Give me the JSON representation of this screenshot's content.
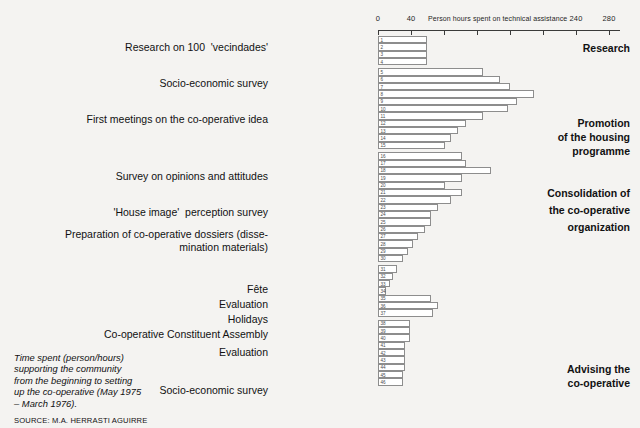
{
  "chart_data": {
    "type": "bar",
    "orientation": "horizontal",
    "title": "",
    "xlabel": "Person hours spent on technical assistance",
    "ylabel": "",
    "xlim": [
      0,
      290
    ],
    "grid": false,
    "legend_position": "right-inline",
    "axis": {
      "ticks": [
        0,
        40,
        80,
        120,
        160,
        200,
        240,
        280
      ],
      "tick_labels_shown": [
        "0",
        "40",
        "240",
        "280"
      ]
    },
    "categories": [
      "1",
      "2",
      "3",
      "4",
      "5",
      "6",
      "7",
      "8",
      "9",
      "10",
      "11",
      "12",
      "13",
      "14",
      "15",
      "16",
      "17",
      "18",
      "19",
      "20",
      "21",
      "22",
      "23",
      "24",
      "25",
      "26",
      "27",
      "28",
      "29",
      "30",
      "31",
      "32",
      "33",
      "34",
      "35",
      "36",
      "37",
      "38",
      "39",
      "40",
      "41",
      "42",
      "43",
      "44",
      "45",
      "46"
    ],
    "values": [
      59,
      59,
      59,
      59,
      126,
      146,
      158,
      187,
      167,
      156,
      126,
      106,
      96,
      88,
      80,
      101,
      106,
      136,
      101,
      80,
      101,
      88,
      72,
      64,
      64,
      56,
      48,
      42,
      36,
      30,
      23,
      18,
      14,
      9,
      64,
      72,
      66,
      38,
      38,
      38,
      32,
      32,
      32,
      32,
      30,
      30
    ],
    "annotations": [
      {
        "text": "Research on 100  'vecindades'",
        "rows": [
          1,
          2,
          3,
          4
        ]
      },
      {
        "text": "Socio-economic survey",
        "rows": [
          5,
          6,
          7,
          8,
          9
        ]
      },
      {
        "text": "First meetings on the co-operative idea",
        "rows": [
          10,
          11,
          12,
          13,
          14,
          15
        ]
      },
      {
        "text": "Survey on opinions and attitudes",
        "rows": [
          16,
          17,
          18,
          19
        ]
      },
      {
        "text": "'House image'  perception survey",
        "rows": [
          20,
          21,
          22
        ]
      },
      {
        "text": "Preparation of co-operative dossiers (disse-\nmination materials)",
        "rows": [
          23,
          24,
          25,
          26,
          27,
          28,
          29,
          30
        ]
      },
      {
        "text": "Fête",
        "rows": [
          31
        ]
      },
      {
        "text": "Evaluation",
        "rows": [
          32,
          33
        ]
      },
      {
        "text": "Holidays",
        "rows": [
          34,
          35
        ]
      },
      {
        "text": "Co-operative Constituent Assembly",
        "rows": [
          36,
          37
        ]
      },
      {
        "text": "Evaluation",
        "rows": [
          38
        ]
      },
      {
        "text": "Socio-economic survey",
        "rows": [
          43,
          44,
          45,
          46
        ]
      }
    ],
    "phases": [
      {
        "label": "Research"
      },
      {
        "label": "Promotion\nof the housing\nprogramme"
      },
      {
        "label": "Consolidation of\nthe co-operative\norganization"
      },
      {
        "label": "Advising the\nco-operative"
      }
    ]
  },
  "axis": {
    "title": "Person hours spent on technical assistance",
    "labels": {
      "t0": "0",
      "t40": "40",
      "t240": "240",
      "t280": "280"
    }
  },
  "tasks": {
    "research": "Research on 100  'vecindades'",
    "socio_economic_survey_1": "Socio-economic survey",
    "first_meetings": "First meetings on the co-operative idea",
    "opinions_survey": "Survey on opinions and attitudes",
    "house_image": "'House image'  perception survey",
    "dossiers_line1": "Preparation of co-operative dossiers (disse-",
    "dossiers_line2": "mination materials)",
    "fete": "Fête",
    "evaluation_1": "Evaluation",
    "holidays": "Holidays",
    "assembly": "Co-operative Constituent Assembly",
    "evaluation_2": "Evaluation",
    "socio_economic_survey_2": "Socio-economic survey"
  },
  "phases": {
    "research": "Research",
    "promotion_l1": "Promotion",
    "promotion_l2": "of the housing",
    "promotion_l3": "programme",
    "consolidation_l1": "Consolidation of",
    "consolidation_l2": "the co-operative",
    "consolidation_l3": "organization",
    "advising_l1": "Advising the",
    "advising_l2": "co-operative"
  },
  "caption": {
    "line1": "Time spent (person/hours)",
    "line2": "supporting the community",
    "line3": "from the beginning to setting",
    "line4": "up the co-operative (May 1975",
    "line5": "– March 1976).",
    "source": "SOURCE: M.A. HERRASTI AGUIRRE"
  }
}
